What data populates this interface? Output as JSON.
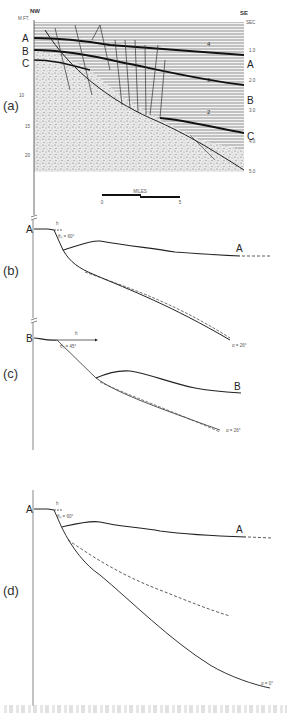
{
  "figure": {
    "panel_a": {
      "label": "(a)",
      "direction_left": "NW",
      "direction_right": "SE",
      "left_axis_unit": "M FT.",
      "right_axis_unit": "SEC",
      "left_ticks": [
        "10",
        "15",
        "20"
      ],
      "right_ticks": [
        "1.0",
        "2.0",
        "3.0",
        "4.0",
        "5.0"
      ],
      "horizons_left": [
        "A",
        "B",
        "C"
      ],
      "horizons_right": [
        "A",
        "B",
        "C"
      ],
      "sequence_numbers": [
        "4",
        "3",
        "2"
      ],
      "scale_bar": {
        "title": "MILES",
        "start": "0",
        "end": "5"
      }
    },
    "panel_b": {
      "label": "(b)",
      "horizon": "A",
      "horizon_end": "A",
      "h_label": "h",
      "theta_label": "θ₀ = 60°",
      "alpha_label": "α = 26°"
    },
    "panel_c": {
      "label": "(c)",
      "horizon": "B",
      "horizon_end": "B",
      "h_label": "h",
      "theta_label": "θ₀ = 45°",
      "alpha_label": "α = 26°"
    },
    "panel_d": {
      "label": "(d)",
      "horizon": "A",
      "horizon_end": "A",
      "h_label": "h",
      "theta_label": "θ₀ = 60°",
      "alpha_label": "α = 0°"
    }
  }
}
